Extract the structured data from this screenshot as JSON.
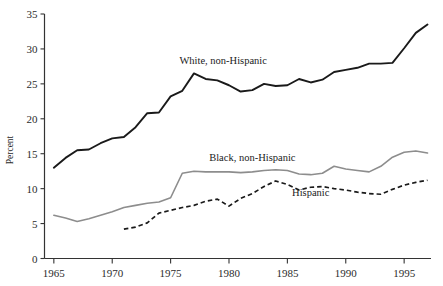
{
  "chart_data": {
    "type": "line",
    "title": "",
    "subtitle": "",
    "xlabel": "",
    "ylabel": "Percent",
    "xlim": [
      1964.2,
      1997.3
    ],
    "ylim": [
      0,
      35
    ],
    "grid": false,
    "legend_position": "inline-annotations",
    "xticks": [
      1965,
      1970,
      1975,
      1980,
      1985,
      1990,
      1995
    ],
    "xtick_labels": [
      "1965",
      "1970",
      "1975",
      "1980",
      "1985",
      "1990",
      "1995"
    ],
    "yticks": [
      0,
      5,
      10,
      15,
      20,
      25,
      30,
      35
    ],
    "ytick_labels": [
      "0",
      "5",
      "10",
      "15",
      "20",
      "25",
      "30",
      "35"
    ],
    "series": [
      {
        "name": "White, non-Hispanic",
        "style": "solid",
        "color": "#1a1a1a",
        "label_x": 1979.5,
        "label_y": 27.9,
        "x": [
          1965,
          1966,
          1967,
          1968,
          1969,
          1970,
          1971,
          1972,
          1973,
          1974,
          1975,
          1976,
          1977,
          1978,
          1979,
          1980,
          1981,
          1982,
          1983,
          1984,
          1985,
          1986,
          1987,
          1988,
          1989,
          1990,
          1991,
          1992,
          1993,
          1994,
          1995,
          1996,
          1997
        ],
        "values": [
          13.0,
          14.4,
          15.5,
          15.6,
          16.5,
          17.2,
          17.4,
          18.8,
          20.8,
          20.9,
          23.2,
          24.0,
          26.5,
          25.7,
          25.5,
          24.8,
          23.9,
          24.1,
          25.0,
          24.7,
          24.8,
          25.7,
          25.2,
          25.6,
          26.7,
          27.0,
          27.3,
          27.9,
          27.9,
          28.0,
          30.1,
          32.3,
          33.5
        ]
      },
      {
        "name": "Black, non-Hispanic",
        "style": "solid",
        "color": "#8d8d8d",
        "label_x": 1982.0,
        "label_y": 14.0,
        "x": [
          1965,
          1966,
          1967,
          1968,
          1969,
          1970,
          1971,
          1972,
          1973,
          1974,
          1975,
          1976,
          1977,
          1978,
          1979,
          1980,
          1981,
          1982,
          1983,
          1984,
          1985,
          1986,
          1987,
          1988,
          1989,
          1990,
          1991,
          1992,
          1993,
          1994,
          1995,
          1996,
          1997
        ],
        "values": [
          6.2,
          5.8,
          5.3,
          5.7,
          6.2,
          6.7,
          7.3,
          7.6,
          7.9,
          8.1,
          8.7,
          12.2,
          12.5,
          12.4,
          12.4,
          12.4,
          12.3,
          12.4,
          12.6,
          12.7,
          12.6,
          12.1,
          12.0,
          12.2,
          13.2,
          12.8,
          12.6,
          12.4,
          13.2,
          14.5,
          15.2,
          15.4,
          15.1
        ]
      },
      {
        "name": "Hispanic",
        "style": "dashed",
        "color": "#1a1a1a",
        "label_x": 1987.0,
        "label_y": 9.0,
        "x": [
          1971,
          1972,
          1973,
          1974,
          1975,
          1976,
          1977,
          1978,
          1979,
          1980,
          1981,
          1982,
          1983,
          1984,
          1985,
          1986,
          1987,
          1988,
          1989,
          1990,
          1991,
          1992,
          1993,
          1994,
          1995,
          1996,
          1997
        ],
        "values": [
          4.2,
          4.5,
          5.1,
          6.5,
          6.9,
          7.3,
          7.6,
          8.2,
          8.5,
          7.5,
          8.6,
          9.3,
          10.3,
          11.1,
          10.6,
          9.8,
          10.2,
          10.3,
          10.0,
          9.8,
          9.5,
          9.3,
          9.2,
          9.9,
          10.5,
          10.9,
          11.2
        ]
      }
    ]
  }
}
